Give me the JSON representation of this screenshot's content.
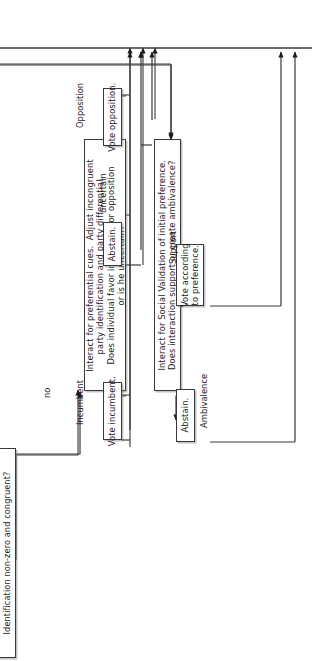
{
  "diagram": {
    "orientation": "text rotated -90 degrees, reads bottom-to-top",
    "line_color": "#3a3a3a",
    "background": "#ffffff"
  },
  "nodes": [
    {
      "id": "identification-check",
      "kind": "decision",
      "text": "Identification non-zero and congruent?"
    },
    {
      "id": "interact-preferential-cues",
      "kind": "process-decision",
      "text": "Interact for preferential cues.  Adjust incongruent\nparty identification and party differential.\nDoes individual favor incumbent or opposition\nor is he uncertain?"
    },
    {
      "id": "vote-opposition",
      "kind": "terminal",
      "text": "Vote opposition."
    },
    {
      "id": "abstain-upper",
      "kind": "terminal",
      "text": "Abstain."
    },
    {
      "id": "vote-incumbent",
      "kind": "terminal",
      "text": "Vote incumbent."
    },
    {
      "id": "interact-social-validation",
      "kind": "process-decision",
      "text": "Interact for Social Validation of initial preference.\nDoes interaction support or create ambivalence?"
    },
    {
      "id": "vote-according-to-preference",
      "kind": "terminal",
      "text": "Vote according\nto preference."
    },
    {
      "id": "abstain-lower",
      "kind": "terminal",
      "text": "Abstain."
    }
  ],
  "edge_labels": [
    {
      "id": "label-no",
      "text": "no"
    },
    {
      "id": "label-opposition",
      "text": "Opposition"
    },
    {
      "id": "label-uncertain",
      "text": "uncertain"
    },
    {
      "id": "label-incumbent",
      "text": "Incumbent"
    },
    {
      "id": "label-support",
      "text": "Support"
    },
    {
      "id": "label-ambivalence",
      "text": "Ambivalence"
    }
  ]
}
